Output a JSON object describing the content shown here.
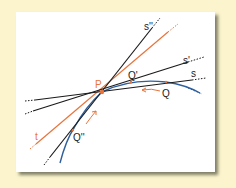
{
  "colors": {
    "background": "#fbf4cc",
    "panel": "#ffffff",
    "secant_line": "#1a1a1a",
    "tangent_line": "#e8743b",
    "curve": "#2e5f9e",
    "point": "#e8743b",
    "arrow": "#e8743b"
  },
  "labels": {
    "P": "P",
    "Q": "Q",
    "Q_prime": "Q'",
    "Q_double_prime": "Q''",
    "s": "s",
    "s_prime": "s'",
    "s_double_prime": "s''",
    "t": "t"
  }
}
